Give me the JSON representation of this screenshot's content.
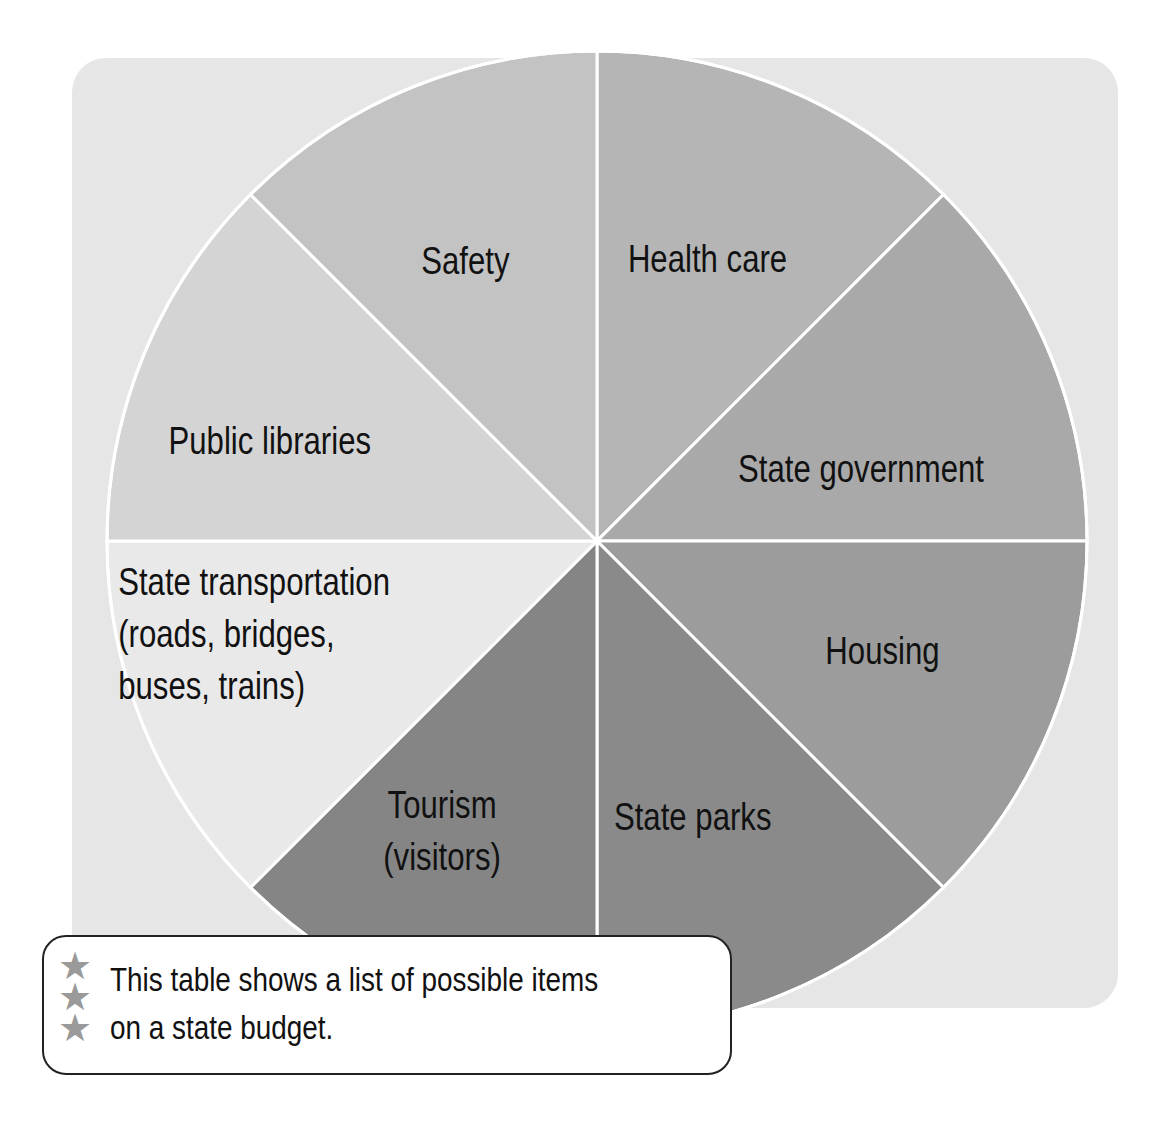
{
  "chart_data": {
    "type": "pie",
    "title": "",
    "slices": [
      {
        "label": [
          "Health care"
        ],
        "value": 1,
        "color": "#b5b5b5"
      },
      {
        "label": [
          "State government"
        ],
        "value": 1,
        "color": "#a9a9a9"
      },
      {
        "label": [
          "Housing"
        ],
        "value": 1,
        "color": "#9c9c9c"
      },
      {
        "label": [
          "State parks"
        ],
        "value": 1,
        "color": "#8a8a8a"
      },
      {
        "label": [
          "Tourism",
          "(visitors)"
        ],
        "value": 1,
        "color": "#858585"
      },
      {
        "label": [
          "State transportation",
          "(roads, bridges,",
          "buses, trains)"
        ],
        "value": 1,
        "color": "#e9e9e9"
      },
      {
        "label": [
          "Public libraries"
        ],
        "value": 1,
        "color": "#d4d4d4"
      },
      {
        "label": [
          "Safety"
        ],
        "value": 1,
        "color": "#c3c3c3"
      }
    ],
    "legend": "none",
    "grid": false
  },
  "colors": {
    "panel_background": "#e6e6e6",
    "divider": "#ffffff",
    "star": "#9a9a9a"
  },
  "note": {
    "icon": "star-icon",
    "lines": [
      "This table shows a list of possible items",
      "on a state budget."
    ]
  }
}
